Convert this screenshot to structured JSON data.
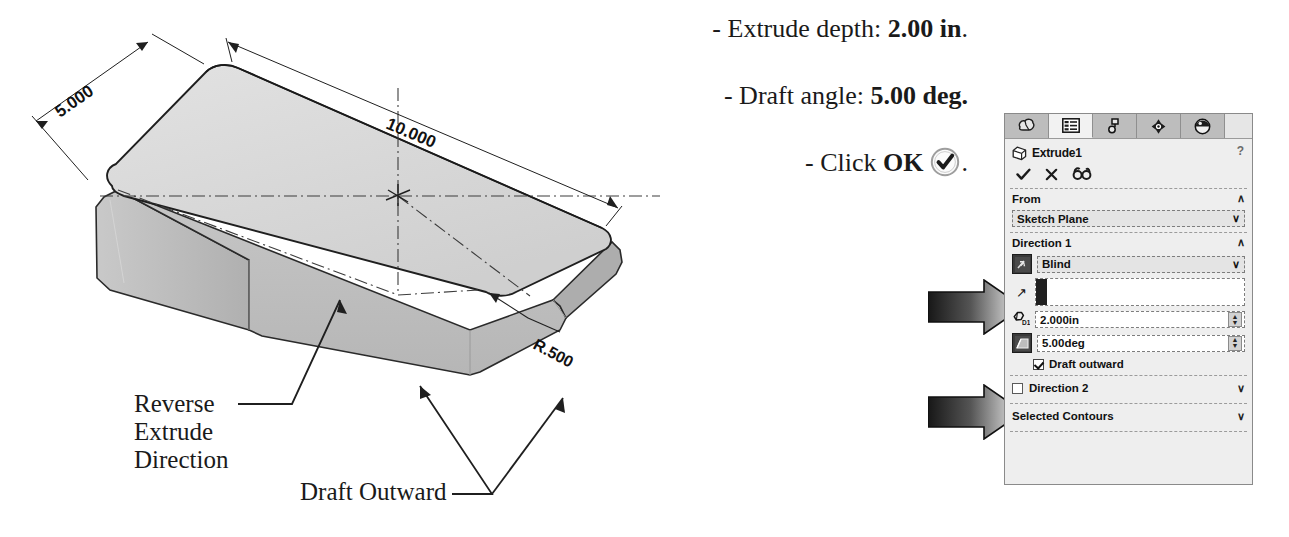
{
  "figure": {
    "model": {
      "dimensions": [
        {
          "name": "width",
          "label": "5.000"
        },
        {
          "name": "length",
          "label": "10.000"
        },
        {
          "name": "corner-radius",
          "label": "R.500"
        }
      ],
      "callouts": [
        {
          "name": "reverse-extrude-direction",
          "label": "Reverse\nExtrude\nDirection"
        },
        {
          "name": "draft-outward",
          "label": "Draft Outward"
        }
      ],
      "colors": {
        "top_face": "#d9d9d9",
        "side_face": "#b3b3b3",
        "front_face": "#c2c2c2",
        "outline": "#1f1f1f",
        "centerline": "#3c3c3c"
      }
    },
    "instructions": [
      {
        "name": "extrude-depth",
        "prefix": "- Extrude depth: ",
        "value": "2.00 in",
        "suffix": "."
      },
      {
        "name": "draft-angle",
        "prefix": "- Draft angle: ",
        "value": "5.00 deg.",
        "suffix": ""
      },
      {
        "name": "click-ok",
        "prefix": "- Click ",
        "value": "OK",
        "suffix": "."
      }
    ],
    "ok_icon_name": "ok-checkmark-icon"
  },
  "property_manager": {
    "tabs": [
      {
        "name": "features-manager-design-tree-tab",
        "icon": "solid-body-icon",
        "active": false
      },
      {
        "name": "property-manager-tab",
        "icon": "property-list-icon",
        "active": true
      },
      {
        "name": "configuration-manager-tab",
        "icon": "configuration-icon",
        "active": false
      },
      {
        "name": "dimxpert-manager-tab",
        "icon": "dimxpert-target-icon",
        "active": false
      },
      {
        "name": "display-manager-tab",
        "icon": "appearance-sphere-icon",
        "active": false
      }
    ],
    "title": "Extrude1",
    "title_icon": "extrude-box-icon",
    "help_label": "?",
    "actions": [
      {
        "name": "accept-ok-button",
        "icon": "checkmark-icon",
        "glyph": "✔"
      },
      {
        "name": "cancel-button",
        "icon": "cross-icon",
        "glyph": "✕"
      },
      {
        "name": "preview-glasses-button",
        "icon": "glasses-icon",
        "glyph": "6ơ"
      }
    ],
    "sections": {
      "from": {
        "label": "From",
        "chevron": "∧",
        "condition": "Sketch Plane",
        "combo_chevron": "∨"
      },
      "direction1": {
        "label": "Direction 1",
        "chevron": "∧",
        "reverse_button_name": "reverse-direction-button",
        "end_condition": "Blind",
        "combo_chevron": "∨",
        "direction_vector_glyph": "↗",
        "direction_vector_name": "direction-of-extrusion-selectbox",
        "depth_label": "D1",
        "depth_value": "2.000in",
        "draft_value": "5.00deg",
        "draft_outward_label": "Draft outward",
        "draft_outward_checked": true
      },
      "direction2": {
        "label": "Direction 2",
        "chevron": "∨",
        "checked": false
      },
      "selected_contours": {
        "label": "Selected Contours",
        "chevron": "∨"
      }
    }
  },
  "annotation_arrows": [
    {
      "name": "pointer-arrow-reverse-direction",
      "target": "reverse-direction-button"
    },
    {
      "name": "pointer-arrow-draft-angle",
      "target": "draft-angle-button"
    }
  ]
}
